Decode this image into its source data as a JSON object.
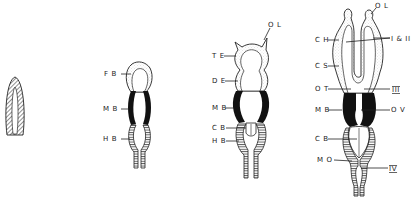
{
  "diagram": {
    "type": "embryonic brain development stages",
    "stages": [
      {
        "id": "stage1",
        "description": "neural tube",
        "labels": []
      },
      {
        "id": "stage2",
        "description": "three-vesicle stage",
        "labels": [
          "FB",
          "MB",
          "HB"
        ]
      },
      {
        "id": "stage3",
        "description": "five-vesicle stage",
        "labels": [
          "OL",
          "TE",
          "DE",
          "MB",
          "CB",
          "HB"
        ]
      },
      {
        "id": "stage4",
        "description": "mature brain plan",
        "labels": [
          "OL",
          "CH",
          "I & II",
          "CS",
          "OT",
          "III",
          "MB",
          "OV",
          "CB",
          "MO",
          "IV"
        ]
      }
    ]
  },
  "labels": {
    "s2_fb": "F B",
    "s2_mb": "M B",
    "s2_hb": "H B",
    "s3_ol": "O L",
    "s3_te": "T E",
    "s3_de": "D E",
    "s3_mb": "M B",
    "s3_cb": "C B",
    "s3_hb": "H B",
    "s4_ol": "O L",
    "s4_ch": "C H",
    "s4_i_ii": "I & II",
    "s4_cs": "C S",
    "s4_ot": "O T",
    "s4_iii": "III",
    "s4_mb": "M B",
    "s4_ov": "O V",
    "s4_cb": "C B",
    "s4_mo": "M O",
    "s4_iv": "IV"
  },
  "colors": {
    "ink": "#222222",
    "midbrain_fill": "#111111",
    "stipple": "#d8d8d8",
    "background": "#ffffff"
  }
}
